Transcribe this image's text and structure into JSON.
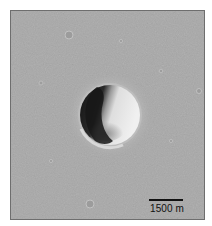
{
  "image": {
    "subject": "impact crater on cratered plain (orbital image)",
    "colors": {
      "surface": "#a8a8a8",
      "shadow": "#1e1e1e",
      "sunlit_wall": "#e6e6e6",
      "frame_border": "#6e6e6e"
    }
  },
  "scale_bar": {
    "label": "1500 m"
  }
}
